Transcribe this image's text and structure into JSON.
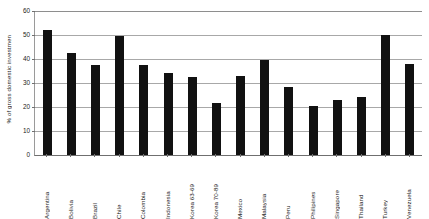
{
  "chart_data": {
    "type": "bar",
    "title": "",
    "xlabel": "",
    "ylabel": "% of gross domestic investmen",
    "ylim": [
      0,
      60
    ],
    "yticks": [
      0,
      10,
      20,
      30,
      40,
      50,
      60
    ],
    "grid": true,
    "legend": false,
    "series_color": "#111111",
    "categories": [
      "Argentina",
      "Bolivia",
      "Brazil",
      "Chile",
      "Colombia",
      "Indonesia",
      "Korea 63-69",
      "Korea 70-89",
      "Mexico",
      "Malaysia",
      "Peru",
      "Philipines",
      "Singapore",
      "Thailand",
      "Turkey",
      "Venezuela"
    ],
    "values": [
      52,
      42.5,
      37.5,
      49.5,
      37.7,
      34,
      32.5,
      21.5,
      33,
      39.5,
      28.5,
      20.5,
      23,
      24,
      50,
      38
    ]
  }
}
